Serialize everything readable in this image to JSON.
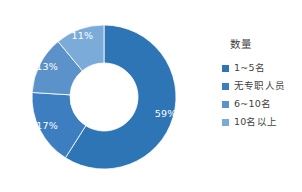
{
  "chart_data": {
    "type": "pie",
    "variant": "donut",
    "title": "",
    "legend_title": "数量",
    "legend_position": "right",
    "start_angle_deg": 0,
    "direction": "clockwise",
    "categories": [
      "1~5名",
      "无专职人员",
      "6~10名",
      "10名以上"
    ],
    "values": [
      59,
      17,
      13,
      11
    ],
    "value_unit": "%",
    "data_labels": [
      "59%",
      "17%",
      "13%",
      "11%"
    ],
    "colors": [
      "#2e75b6",
      "#3c7ebf",
      "#5b92c9",
      "#7aabd9"
    ],
    "series": [
      {
        "name": "数量",
        "points": [
          {
            "label": "1~5名",
            "value": 59,
            "data_label": "59%",
            "color": "#2e75b6"
          },
          {
            "label": "无专职人员",
            "value": 17,
            "data_label": "17%",
            "color": "#3c7ebf"
          },
          {
            "label": "6~10名",
            "value": 13,
            "data_label": "13%",
            "color": "#5b92c9"
          },
          {
            "label": "10名以上",
            "value": 11,
            "data_label": "11%",
            "color": "#7aabd9"
          }
        ]
      }
    ],
    "grid": false,
    "xlabel": "",
    "ylabel": ""
  },
  "legend": {
    "title": "数量",
    "items": [
      {
        "label": "1~5名",
        "color": "#2e75b6"
      },
      {
        "label": "无专职人员",
        "color": "#3c7ebf"
      },
      {
        "label": "6~10名",
        "color": "#5b92c9"
      },
      {
        "label": "10名以上",
        "color": "#7aabd9"
      }
    ]
  },
  "labels": {
    "slice_1": "59%",
    "slice_2": "17%",
    "slice_3": "13%",
    "slice_4": "11%"
  }
}
